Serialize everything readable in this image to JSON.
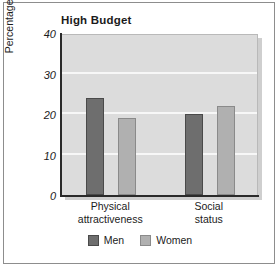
{
  "chart_data": {
    "type": "bar",
    "title": "High Budget",
    "subtitle": "",
    "xlabel": "",
    "ylabel": "Percentage of money spent",
    "categories": [
      "Physical attractiveness",
      "Social status"
    ],
    "category_lines": [
      [
        "Physical",
        "attractiveness"
      ],
      [
        "Social",
        "status"
      ]
    ],
    "series": [
      {
        "name": "Men",
        "values": [
          24,
          20
        ],
        "color": "#6e6e6e"
      },
      {
        "name": "Women",
        "values": [
          19,
          22
        ],
        "color": "#b0b0b0"
      }
    ],
    "ylim": [
      0,
      40
    ],
    "yticks": [
      0,
      10,
      20,
      30,
      40
    ],
    "ytick_labels": [
      "0",
      "10",
      "20",
      "30",
      "40"
    ],
    "grid": true,
    "grid_color": "#f7f7f7",
    "plot_background": "#dcdcdc",
    "legend_position": "bottom",
    "legend": [
      "Men",
      "Women"
    ]
  },
  "legend_entries": [
    {
      "label": "Men"
    },
    {
      "label": "Women"
    }
  ]
}
